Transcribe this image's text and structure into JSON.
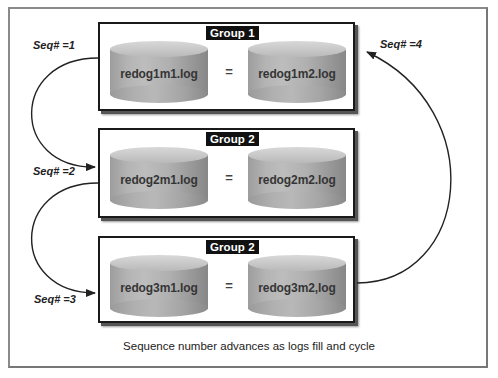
{
  "diagram": {
    "groups": [
      {
        "label": "Group 1",
        "members": [
          {
            "label": "redog1m1.log"
          },
          {
            "label": "redog1m2.log"
          }
        ],
        "equals": "="
      },
      {
        "label": "Group 2",
        "members": [
          {
            "label": "redog2m1.log"
          },
          {
            "label": "redog2m2.log"
          }
        ],
        "equals": "="
      },
      {
        "label": "Group 2",
        "members": [
          {
            "label": "redog3m1.log"
          },
          {
            "label": "redog3m2,log"
          }
        ],
        "equals": "="
      }
    ],
    "sequence_labels": [
      "Seq# =1",
      "Seq# =2",
      "Seq# =3",
      "Seq# =4"
    ],
    "caption": "Sequence number advances as logs fill and cycle",
    "colors": {
      "border": "#1a1a1a",
      "label_bg": "#111111",
      "cylinder": "#b0b0b0",
      "arrow": "#222222"
    }
  }
}
